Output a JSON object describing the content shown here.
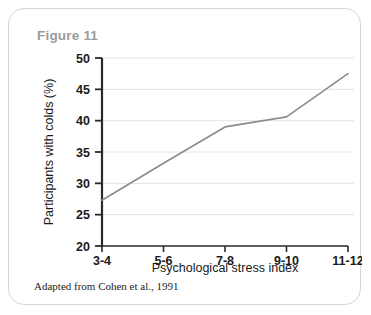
{
  "card": {
    "title": "Figure 11",
    "border_color": "#d6d6d6",
    "title_color": "#9b9b9b",
    "background": "#ffffff"
  },
  "footnote": "Adapted from Cohen et al., 1991",
  "chart_data": {
    "type": "line",
    "title": "",
    "categories": [
      "3-4",
      "5-6",
      "7-8",
      "9-10",
      "11-12"
    ],
    "values": [
      27.3,
      33.2,
      39.0,
      40.6,
      47.5
    ],
    "series": [
      {
        "name": "Participants with colds",
        "values": [
          27.3,
          33.2,
          39.0,
          40.6,
          47.5
        ]
      }
    ],
    "xlabel": "Psychological stress index",
    "ylabel": "Participants with colds (%)",
    "ylim": [
      20,
      50
    ],
    "yticks": [
      20,
      25,
      30,
      35,
      40,
      45,
      50
    ],
    "ytick_labels": [
      "20",
      "25",
      "30",
      "35",
      "40",
      "45",
      "50"
    ],
    "xtick_labels": [
      "3-4",
      "5-6",
      "7-8",
      "9-10",
      "11-12"
    ],
    "grid": "horizontal",
    "legend": "none",
    "line_color": "#8c8c94",
    "grid_color": "#e4e4e4",
    "axis_color": "#2a2a2a"
  }
}
